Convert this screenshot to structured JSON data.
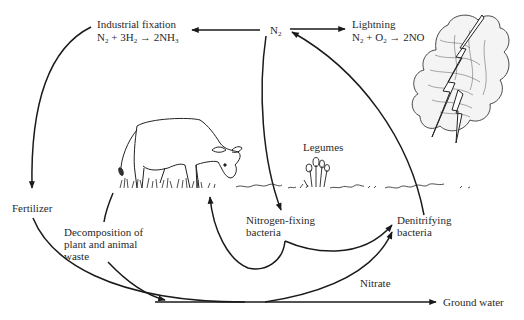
{
  "diagram": {
    "nodes": {
      "n2": {
        "label": "N",
        "sub": "2"
      },
      "industrial": {
        "title": "Industrial fixation",
        "equation": {
          "r1": "N",
          "r1sub": "2",
          "plus": " + ",
          "r2": "3H",
          "r2sub": "2",
          "arrow": " → ",
          "p": "2NH",
          "psub": "3"
        }
      },
      "lightning": {
        "title": "Lightning",
        "equation": {
          "r1": "N",
          "r1sub": "2",
          "plus": " + ",
          "r2": "O",
          "r2sub": "2",
          "arrow": " → ",
          "p": "2NO"
        }
      },
      "legumes": {
        "label": "Legumes"
      },
      "fertilizer": {
        "label": "Fertilizer"
      },
      "decomposition": {
        "line1": "Decomposition of",
        "line2": "plant and animal",
        "line3": "waste"
      },
      "nitrogen_fixing": {
        "line1": "Nitrogen-fixing",
        "line2": "bacteria"
      },
      "denitrifying": {
        "line1": "Denitrifying",
        "line2": "bacteria"
      },
      "nitrate": {
        "label": "Nitrate"
      },
      "ground_water": {
        "label": "Ground water"
      }
    },
    "edges": [
      {
        "from": "N2",
        "to": "Industrial fixation"
      },
      {
        "from": "N2",
        "to": "Lightning"
      },
      {
        "from": "Industrial fixation",
        "to": "Fertilizer"
      },
      {
        "from": "N2",
        "to": "Nitrogen-fixing bacteria"
      },
      {
        "from": "Nitrogen-fixing bacteria",
        "to": "Plants (ground)"
      },
      {
        "from": "Plants (ground)",
        "to": "Decomposition of plant and animal waste"
      },
      {
        "from": "Fertilizer",
        "to": "Nitrate"
      },
      {
        "from": "Decomposition of plant and animal waste",
        "to": "Nitrate"
      },
      {
        "from": "Nitrate",
        "to": "Ground water"
      },
      {
        "from": "Nitrate",
        "to": "Denitrifying bacteria"
      },
      {
        "from": "Nitrogen-fixing bacteria",
        "to": "Denitrifying bacteria"
      },
      {
        "from": "Denitrifying bacteria",
        "to": "N2"
      }
    ],
    "illustrations": [
      "cow",
      "legumes",
      "storm-cloud",
      "lightning-bolt",
      "grass"
    ],
    "colors": {
      "ink": "#1a1a1a",
      "background": "#ffffff"
    }
  }
}
